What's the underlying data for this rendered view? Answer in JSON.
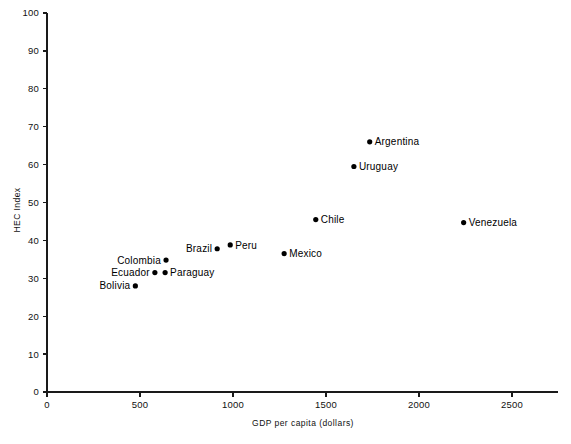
{
  "chart_data": {
    "type": "scatter",
    "title": "",
    "xlabel": "GDP per capita (dollars)",
    "ylabel": "HEC Index",
    "xlim": [
      0,
      2750
    ],
    "ylim": [
      0,
      100
    ],
    "grid": false,
    "legend": "none",
    "xticks": [
      "0",
      "500",
      "1000",
      "1500",
      "2000",
      "2500"
    ],
    "xtick_values": [
      0,
      500,
      1000,
      1500,
      2000,
      2500
    ],
    "yticks": [
      "0",
      "10",
      "20",
      "30",
      "40",
      "50",
      "60",
      "70",
      "80",
      "90",
      "100"
    ],
    "ytick_values": [
      0,
      10,
      20,
      30,
      40,
      50,
      60,
      70,
      80,
      90,
      100
    ],
    "points": [
      {
        "name": "Bolivia",
        "x": 475,
        "y": 28,
        "label_side": "left"
      },
      {
        "name": "Ecuador",
        "x": 580,
        "y": 31.5,
        "label_side": "left"
      },
      {
        "name": "Colombia",
        "x": 640,
        "y": 34.8,
        "label_side": "left"
      },
      {
        "name": "Paraguay",
        "x": 635,
        "y": 31.5,
        "label_side": "right"
      },
      {
        "name": "Brazil",
        "x": 915,
        "y": 37.8,
        "label_side": "left"
      },
      {
        "name": "Peru",
        "x": 985,
        "y": 38.8,
        "label_side": "right"
      },
      {
        "name": "Mexico",
        "x": 1275,
        "y": 36.5,
        "label_side": "right"
      },
      {
        "name": "Chile",
        "x": 1445,
        "y": 45.5,
        "label_side": "right"
      },
      {
        "name": "Uruguay",
        "x": 1650,
        "y": 59.5,
        "label_side": "right"
      },
      {
        "name": "Argentina",
        "x": 1735,
        "y": 66.0,
        "label_side": "right"
      },
      {
        "name": "Venezuela",
        "x": 2240,
        "y": 44.7,
        "label_side": "right"
      }
    ]
  }
}
